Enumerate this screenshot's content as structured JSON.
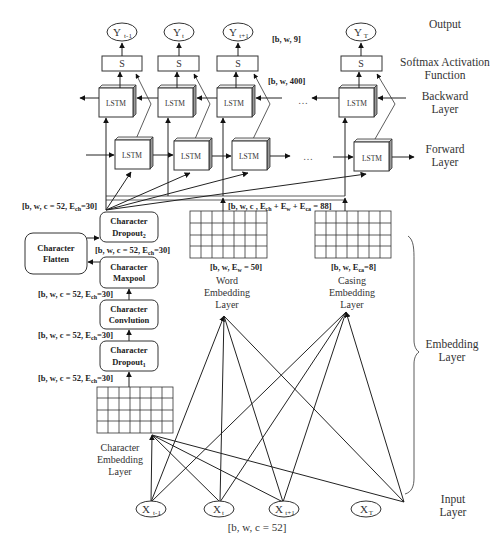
{
  "side_labels": {
    "output": "Output",
    "softmax_1": "Softmax Activation",
    "softmax_2": "Function",
    "backward_1": "Backward",
    "backward_2": "Layer",
    "forward_1": "Forward",
    "forward_2": "Layer",
    "embedding_1": "Embedding",
    "embedding_2": "Layer",
    "input_1": "Input",
    "input_2": "Layer"
  },
  "outputs": [
    {
      "base": "Y",
      "sub": "t-1"
    },
    {
      "base": "Y",
      "sub": "t"
    },
    {
      "base": "Y",
      "sub": "t+1"
    },
    {
      "base": "Y",
      "sub": "T"
    }
  ],
  "inputs": [
    {
      "base": "X",
      "sub": "t-1"
    },
    {
      "base": "X",
      "sub": "t"
    },
    {
      "base": "X",
      "sub": "t+1"
    },
    {
      "base": "X",
      "sub": "T"
    }
  ],
  "softmax_symbol": "S",
  "lstm_label": "LSTM",
  "ellipsis": "…",
  "shapes": {
    "output_shape": "[b, w, 9]",
    "lstm_shape": "[b, w, 400]",
    "concat_shape_a": "[b, w, c , E",
    "concat_sub_ch": "ch",
    "concat_shape_b": " + E",
    "concat_sub_w": "w",
    "concat_shape_c": " + E",
    "concat_sub_ca": "ca",
    "concat_shape_d": " = 88]",
    "char_shape_a": "[b, w, c = 52, E",
    "char_shape_sub": "ch",
    "char_shape_b": "=30]",
    "word_shape_a": "[b, w, E",
    "word_shape_sub": "w",
    "word_shape_b": " = 50]",
    "casing_shape_a": "[b, w, E",
    "casing_shape_sub": "ca",
    "casing_shape_b": "=8]",
    "input_shape": "[b, w, c = 52]"
  },
  "char_blocks": {
    "dropout2_1": "Character",
    "dropout2_2": "Dropout",
    "dropout2_sub": "2",
    "flatten_1": "Character",
    "flatten_2": "Flatten",
    "maxpool_1": "Character",
    "maxpool_2": "Maxpool",
    "conv_1": "Character",
    "conv_2": "Convlution",
    "dropout1_1": "Character",
    "dropout1_2": "Dropout",
    "dropout1_sub": "1"
  },
  "embedding_labels": {
    "word_1": "Word",
    "word_2": "Embedding",
    "word_3": "Layer",
    "casing_1": "Casing",
    "casing_2": "Embedding",
    "casing_3": "Layer",
    "char_1": "Character",
    "char_2": "Embedding",
    "char_3": "Layer"
  }
}
